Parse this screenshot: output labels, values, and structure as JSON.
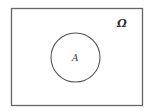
{
  "diagram": {
    "type": "venn",
    "universe": {
      "label": "Ω",
      "x": 11,
      "y": 8,
      "width": 132,
      "height": 98
    },
    "sets": [
      {
        "label": "A",
        "cx": 75.5,
        "cy": 57.5,
        "r": 24.5
      }
    ],
    "colors": {
      "stroke": "#555555",
      "background": "#ffffff",
      "text": "#333333"
    }
  }
}
